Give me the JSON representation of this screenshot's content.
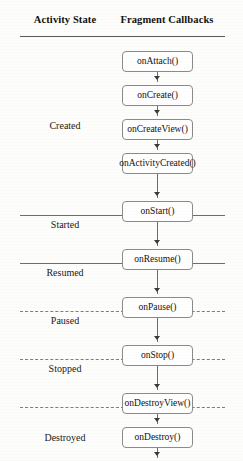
{
  "header": {
    "state_column": "Activity State",
    "callbacks_column": "Fragment Callbacks"
  },
  "chart_data": {
    "type": "diagram",
    "columns": [
      "Activity State",
      "Fragment Callbacks"
    ],
    "rows": [
      {
        "state": "Created",
        "callbacks": [
          "onAttach()",
          "onCreate()",
          "onCreateView()",
          "onActivityCreated()"
        ],
        "separator_below": "solid"
      },
      {
        "state": "Started",
        "callbacks": [
          "onStart()"
        ],
        "separator_below": "solid"
      },
      {
        "state": "Resumed",
        "callbacks": [
          "onResume()"
        ],
        "separator_below": "dashed"
      },
      {
        "state": "Paused",
        "callbacks": [
          "onPause()"
        ],
        "separator_below": "dashed"
      },
      {
        "state": "Stopped",
        "callbacks": [
          "onStop()"
        ],
        "separator_below": "dashed"
      },
      {
        "state": "Destroyed",
        "callbacks": [
          "onDestroyView()",
          "onDestroy()",
          "onDetach()"
        ],
        "separator_below": "solid"
      }
    ],
    "flow_order": [
      "onAttach()",
      "onCreate()",
      "onCreateView()",
      "onActivityCreated()",
      "onStart()",
      "onResume()",
      "onPause()",
      "onStop()",
      "onDestroyView()",
      "onDestroy()",
      "onDetach()"
    ],
    "colors": {
      "box_border": "#8a8a8a",
      "box_fill": "#ffffff",
      "rule": "#5a5a5a",
      "dashed_rule": "#7d7d7d",
      "connector": "#6a6a6a",
      "text": "#1a1a1a",
      "background": "#fdfdfb"
    }
  },
  "states": {
    "created": "Created",
    "started": "Started",
    "resumed": "Resumed",
    "paused": "Paused",
    "stopped": "Stopped",
    "destroyed": "Destroyed"
  },
  "callbacks": {
    "on_attach": "onAttach()",
    "on_create": "onCreate()",
    "on_create_view": "onCreateView()",
    "on_activity_created": "onActivityCreated()",
    "on_start": "onStart()",
    "on_resume": "onResume()",
    "on_pause": "onPause()",
    "on_stop": "onStop()",
    "on_destroy_view": "onDestroyView()",
    "on_destroy": "onDestroy()",
    "on_detach": "onDetach()"
  }
}
